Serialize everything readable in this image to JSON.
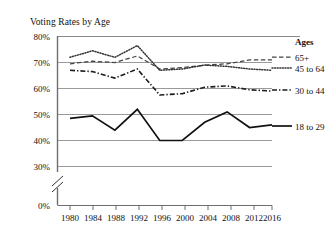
{
  "chart": {
    "title": "Voting Rates by Age",
    "legend_header": "Ages"
  },
  "axes": {
    "y_ticks": [
      "80%",
      "70%",
      "60%",
      "50%",
      "40%",
      "30%",
      "0%"
    ],
    "x_ticks": [
      "1980",
      "1984",
      "1988",
      "1992",
      "1996",
      "2000",
      "2004",
      "2008",
      "2012",
      "2016"
    ],
    "y_break": true
  },
  "legend": {
    "items": [
      {
        "label": "65+"
      },
      {
        "label": "45 to 64"
      },
      {
        "label": "30 to 44"
      },
      {
        "label": "18 to 29"
      }
    ]
  },
  "chart_data": {
    "type": "line",
    "title": "Voting Rates by Age",
    "xlabel": "",
    "ylabel": "",
    "x": [
      1980,
      1984,
      1988,
      1992,
      1996,
      2000,
      2004,
      2008,
      2012,
      2016
    ],
    "categories": [
      "1980",
      "1984",
      "1988",
      "1992",
      "1996",
      "2000",
      "2004",
      "2008",
      "2012",
      "2016"
    ],
    "ylim": [
      30,
      80
    ],
    "y_ticks": [
      30,
      40,
      50,
      60,
      70,
      80
    ],
    "y_axis_break_from": 0,
    "y_axis_break_to": 30,
    "grid": true,
    "legend_position": "right",
    "legend_title": "Ages",
    "series": [
      {
        "name": "65+",
        "style": "dashed",
        "values": [
          69.5,
          70.5,
          70.0,
          72.5,
          67.5,
          68.0,
          69.0,
          69.5,
          71.0,
          71.0
        ]
      },
      {
        "name": "45 to 64",
        "style": "dotted",
        "values": [
          72.0,
          74.5,
          72.0,
          76.5,
          67.0,
          67.5,
          69.0,
          68.5,
          67.5,
          67.0
        ]
      },
      {
        "name": "30 to 44",
        "style": "dash-dot",
        "values": [
          67.0,
          66.5,
          64.0,
          67.5,
          57.5,
          58.0,
          60.5,
          61.0,
          59.5,
          59.0
        ]
      },
      {
        "name": "18 to 29",
        "style": "solid",
        "values": [
          48.5,
          49.5,
          44.0,
          52.0,
          40.0,
          40.0,
          47.0,
          51.0,
          45.0,
          46.0
        ]
      }
    ]
  }
}
